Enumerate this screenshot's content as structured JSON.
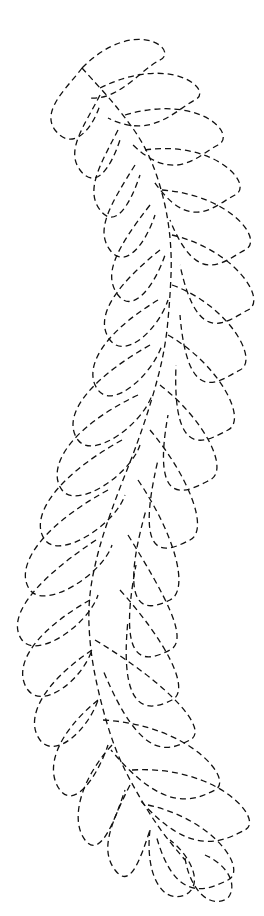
{
  "figure": {
    "line_style": "dashed",
    "stroke_color": "#111111",
    "background_color": "#ffffff",
    "left_plume_count": 14,
    "right_plume_count": 16
  }
}
